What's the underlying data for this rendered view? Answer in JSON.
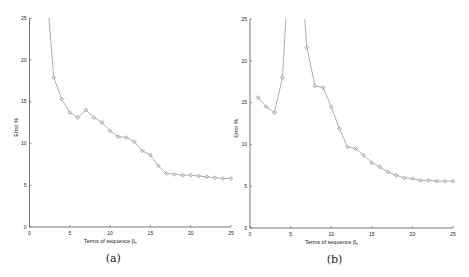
{
  "chart_data": [
    {
      "id": "a",
      "type": "line",
      "caption": "(a)",
      "title": "",
      "xlabel": "Terms of sequence β_n",
      "ylabel": "Error %",
      "xlim": [
        0,
        25
      ],
      "ylim": [
        0,
        25
      ],
      "xticks": [
        0,
        5,
        10,
        15,
        20,
        25
      ],
      "yticks": [
        0,
        5,
        10,
        15,
        20,
        25
      ],
      "grid": false,
      "legend": null,
      "marker": "diamond",
      "clipped_above": [
        2
      ],
      "x": [
        2,
        3,
        4,
        5,
        6,
        7,
        8,
        9,
        10,
        11,
        12,
        13,
        14,
        15,
        16,
        17,
        18,
        19,
        20,
        21,
        22,
        23,
        24,
        25
      ],
      "values": [
        30,
        17.9,
        15.3,
        13.7,
        13.1,
        14.0,
        13.1,
        12.5,
        11.5,
        10.8,
        10.7,
        10.2,
        9.1,
        8.6,
        7.3,
        6.4,
        6.3,
        6.2,
        6.2,
        6.1,
        6.0,
        5.9,
        5.8,
        5.8
      ]
    },
    {
      "id": "b",
      "type": "line",
      "caption": "(b)",
      "title": "",
      "xlabel": "Terms of sequence β_n",
      "ylabel": "Error %",
      "xlim": [
        0,
        25
      ],
      "ylim": [
        0,
        25
      ],
      "xticks": [
        0,
        5,
        10,
        15,
        20,
        25
      ],
      "yticks": [
        0,
        5,
        10,
        15,
        20,
        25
      ],
      "grid": false,
      "legend": null,
      "marker": "diamond",
      "clipped_above": [
        5,
        6
      ],
      "x": [
        1,
        2,
        3,
        4,
        5,
        6,
        7,
        8,
        9,
        10,
        11,
        12,
        13,
        14,
        15,
        16,
        17,
        18,
        19,
        20,
        21,
        22,
        23,
        24,
        25
      ],
      "values": [
        15.6,
        14.5,
        13.8,
        18.0,
        35,
        35,
        21.6,
        17.0,
        16.8,
        14.5,
        11.9,
        9.7,
        9.5,
        8.7,
        7.8,
        7.3,
        6.7,
        6.3,
        6.0,
        5.9,
        5.7,
        5.7,
        5.6,
        5.6,
        5.6
      ]
    }
  ],
  "colors": {
    "axis": "#555555",
    "line": "#9a9a9a",
    "marker": "#8a8a8a",
    "text": "#222222"
  }
}
